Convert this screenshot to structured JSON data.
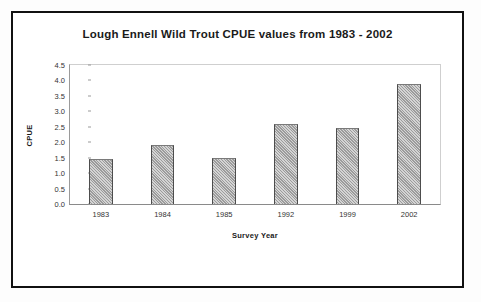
{
  "chart_data": {
    "type": "bar",
    "title": "Lough Ennell Wild Trout CPUE values from 1983 - 2002",
    "xlabel": "Survey Year",
    "ylabel": "CPUE",
    "categories": [
      "1983",
      "1984",
      "1985",
      "1992",
      "1999",
      "2002"
    ],
    "values": [
      1.45,
      1.9,
      1.5,
      2.6,
      2.45,
      3.9
    ],
    "ylim": [
      0.0,
      4.5
    ],
    "ytick_labels": [
      "0.0",
      "0.5",
      "1.0",
      "1.5",
      "2.0",
      "2.5",
      "3.0",
      "3.5",
      "4.0",
      "4.5"
    ],
    "ytick_values": [
      0.0,
      0.5,
      1.0,
      1.5,
      2.0,
      2.5,
      3.0,
      3.5,
      4.0,
      4.5
    ],
    "grid": false,
    "legend": null,
    "series": [
      {
        "name": "CPUE",
        "values": [
          1.45,
          1.9,
          1.5,
          2.6,
          2.45,
          3.9
        ]
      }
    ],
    "colors": {
      "bar_fill": "#a9a9a9",
      "bar_border": "#4d4d4d",
      "plot_border": "#cfcfcf",
      "text": "#1a1a1a",
      "frame": "#111111",
      "background": "#ffffff"
    }
  }
}
